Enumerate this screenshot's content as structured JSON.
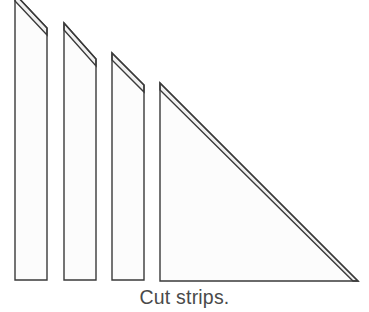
{
  "figure": {
    "caption": "Cut strips.",
    "background_color": "#ffffff",
    "outline_color": "#3a3a3a",
    "face_fill_color": "#fcfcfc",
    "bevel_fill_color": "#f0f0f0",
    "stroke_width": 1.4,
    "canvas": {
      "width": 369,
      "height": 312
    },
    "shapes": [
      {
        "name": "strip-1",
        "label": "Narrow strip 1 (leftmost, top cropped)",
        "outer_points": "15,-6 47,28 47,280 15,280",
        "bevel_points": "15,-6 47,28 47,35 15,1",
        "face_points": "15,1 47,35 47,280 15,280",
        "left_edge_x": 15,
        "right_edge_x": 47,
        "apex_y": -6,
        "right_top_y": 28,
        "bottom_y": 280
      },
      {
        "name": "strip-2",
        "label": "Narrow strip 2",
        "outer_points": "64,23 96,59 96,280 64,280",
        "bevel_points": "64,23 96,59 96,66 64,30",
        "face_points": "64,30 96,66 96,280 64,280",
        "left_edge_x": 64,
        "right_edge_x": 96,
        "apex_y": 23,
        "right_top_y": 59,
        "bottom_y": 280
      },
      {
        "name": "strip-3",
        "label": "Narrow strip 3",
        "outer_points": "112,53 144,85 144,280 112,280",
        "bevel_points": "112,53 144,85 144,92 112,60",
        "face_points": "112,60 144,92 144,280 112,280",
        "left_edge_x": 112,
        "right_edge_x": 144,
        "apex_y": 53,
        "right_top_y": 85,
        "bottom_y": 280
      },
      {
        "name": "triangle-large",
        "label": "Large right triangle",
        "outer_points": "160,83 358,281 160,281",
        "bevel_points": "160,83 358,281 353,281 160,90",
        "face_points": "160,90 353,281 160,281",
        "left_edge_x": 160,
        "apex_y": 83,
        "tip_x": 358,
        "bottom_y": 281
      }
    ]
  }
}
